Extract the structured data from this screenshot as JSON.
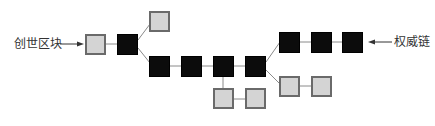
{
  "diagram": {
    "type": "blockchain-fork",
    "labels": {
      "genesis": "创世区块",
      "main_chain": "权威链"
    },
    "colors": {
      "main_chain_block": "#0c0c0c",
      "orphan_block": "#d4d4d4",
      "orphan_border": "#6a6a6a",
      "connector": "#8a8a8a",
      "arrow": "#333333"
    },
    "blocks": [
      {
        "id": "genesis",
        "kind": "gray"
      },
      {
        "id": "b1",
        "kind": "black"
      },
      {
        "id": "fork-top",
        "kind": "gray"
      },
      {
        "id": "b2",
        "kind": "black"
      },
      {
        "id": "b3",
        "kind": "black"
      },
      {
        "id": "b4",
        "kind": "black"
      },
      {
        "id": "b5",
        "kind": "black"
      },
      {
        "id": "side-a1",
        "kind": "gray"
      },
      {
        "id": "side-a2",
        "kind": "gray"
      },
      {
        "id": "b6",
        "kind": "black"
      },
      {
        "id": "b7",
        "kind": "black"
      },
      {
        "id": "b8",
        "kind": "black"
      },
      {
        "id": "side-b1",
        "kind": "gray"
      },
      {
        "id": "side-b2",
        "kind": "gray"
      }
    ]
  }
}
